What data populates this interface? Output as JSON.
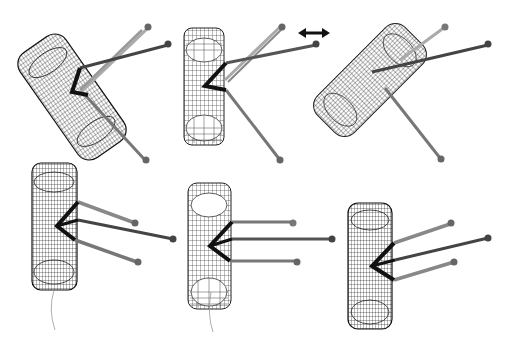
{
  "figure": {
    "title": "",
    "background": "#ffffff",
    "colors": {
      "wireframe": "#1a1a1a",
      "link_dark": "#3a3a3a",
      "link_mid": "#6a6a6a",
      "link_light": "#9a9a9a",
      "joint": "#555555",
      "arrow": "#111111"
    },
    "arrow": {
      "symbol": "double-headed-arrow",
      "x": 314,
      "y": 33
    },
    "panels": [
      {
        "id": "top-left",
        "cx": 70,
        "cy": 95,
        "w": 60,
        "h": 130,
        "angle": -35,
        "row": 1,
        "col": 1
      },
      {
        "id": "top-center",
        "cx": 220,
        "cy": 90,
        "w": 40,
        "h": 115,
        "angle": 0,
        "row": 1,
        "col": 2
      },
      {
        "id": "top-right",
        "cx": 370,
        "cy": 80,
        "w": 50,
        "h": 120,
        "angle": 45,
        "row": 1,
        "col": 3
      },
      {
        "id": "bottom-left",
        "cx": 55,
        "cy": 225,
        "w": 45,
        "h": 130,
        "angle": 0,
        "row": 2,
        "col": 1
      },
      {
        "id": "bottom-center",
        "cx": 210,
        "cy": 250,
        "w": 45,
        "h": 125,
        "angle": 0,
        "row": 2,
        "col": 2
      },
      {
        "id": "bottom-right",
        "cx": 370,
        "cy": 265,
        "w": 45,
        "h": 125,
        "angle": 0,
        "row": 2,
        "col": 3
      }
    ]
  }
}
